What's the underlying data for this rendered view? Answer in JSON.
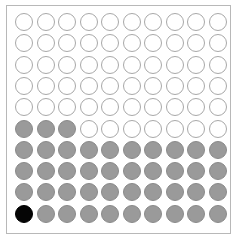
{
  "chart_data": {
    "type": "waffle",
    "rows": 10,
    "cols": 10,
    "total": 100,
    "fill_order": "bottom-left to top-right, row by row",
    "counts": {
      "highlight": 1,
      "filled": 42,
      "empty": 57
    },
    "categories": [
      "highlight",
      "filled",
      "empty"
    ],
    "values": [
      1,
      42,
      57
    ],
    "colors": {
      "highlight": "#050505",
      "filled": "#9a9a9a",
      "empty": "#ffffff",
      "outline": "#a8a8a8"
    },
    "title": "",
    "legend": "none"
  }
}
